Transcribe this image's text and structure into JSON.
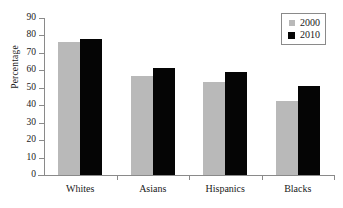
{
  "chart_data": {
    "type": "bar",
    "title": "",
    "xlabel": "",
    "ylabel": "Percentage",
    "categories": [
      "Whites",
      "Asians",
      "Hispanics",
      "Blacks"
    ],
    "ylim": [
      0,
      90
    ],
    "yticks": [
      0,
      10,
      20,
      30,
      40,
      50,
      60,
      70,
      80,
      90
    ],
    "grid": false,
    "legend_position": "top-right",
    "series": [
      {
        "name": "2000",
        "color": "#b9b9b9",
        "values": [
          76.5,
          57,
          53.5,
          42.5
        ]
      },
      {
        "name": "2010",
        "color": "#050505",
        "values": [
          78,
          61.5,
          59,
          51
        ]
      }
    ]
  },
  "axis": {
    "y_title": "Percentage",
    "y_tick_labels": [
      "90",
      "80",
      "70",
      "60",
      "50",
      "40",
      "30",
      "20",
      "10",
      "0"
    ]
  },
  "legend": {
    "entries": [
      {
        "label": "2000",
        "swatch": "gray-square-icon"
      },
      {
        "label": "2010",
        "swatch": "black-square-icon"
      }
    ]
  }
}
